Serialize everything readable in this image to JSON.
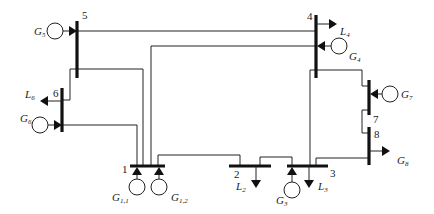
{
  "diagram": {
    "type": "power-system-single-line",
    "buses": [
      {
        "id": "1",
        "label": "1"
      },
      {
        "id": "2",
        "label": "2"
      },
      {
        "id": "3",
        "label": "3"
      },
      {
        "id": "4",
        "label": "4"
      },
      {
        "id": "5",
        "label": "5"
      },
      {
        "id": "6",
        "label": "6"
      },
      {
        "id": "7",
        "label": "7"
      },
      {
        "id": "8",
        "label": "8"
      }
    ],
    "generators": [
      {
        "bus": "1",
        "label": "G",
        "sub": "1,1"
      },
      {
        "bus": "1",
        "label": "G",
        "sub": "1,2"
      },
      {
        "bus": "3",
        "label": "G",
        "sub": "3"
      },
      {
        "bus": "4",
        "label": "G",
        "sub": "4"
      },
      {
        "bus": "5",
        "label": "G",
        "sub": "5"
      },
      {
        "bus": "6",
        "label": "G",
        "sub": "6"
      },
      {
        "bus": "7",
        "label": "G",
        "sub": "7"
      }
    ],
    "loads": [
      {
        "bus": "2",
        "label": "L",
        "sub": "2"
      },
      {
        "bus": "3",
        "label": "L",
        "sub": "3"
      },
      {
        "bus": "4",
        "label": "L",
        "sub": "4"
      },
      {
        "bus": "6",
        "label": "L",
        "sub": "6"
      },
      {
        "bus": "8",
        "label": "G",
        "sub": "8"
      }
    ],
    "branches": [
      [
        "1",
        "2"
      ],
      [
        "2",
        "3"
      ],
      [
        "1",
        "4"
      ],
      [
        "1",
        "5"
      ],
      [
        "1",
        "6"
      ],
      [
        "5",
        "4"
      ],
      [
        "5",
        "6"
      ],
      [
        "4",
        "3"
      ],
      [
        "4",
        "7"
      ],
      [
        "7",
        "8"
      ],
      [
        "8",
        "3"
      ]
    ]
  }
}
